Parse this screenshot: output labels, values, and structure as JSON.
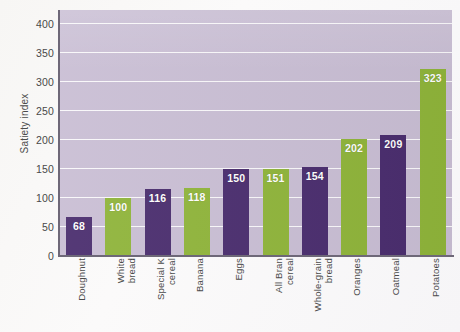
{
  "chart_data": {
    "type": "bar",
    "title": "",
    "xlabel": "",
    "ylabel": "Satiety index",
    "ylim": [
      0,
      425
    ],
    "yticks": [
      0,
      50,
      100,
      150,
      200,
      250,
      300,
      350,
      400
    ],
    "ytick_labels": [
      "0",
      "50",
      "100",
      "150",
      "200",
      "250",
      "300",
      "350",
      "400"
    ],
    "grid": true,
    "gridlines": "horizontal",
    "legend": "none",
    "categories": [
      "Doughnut",
      "White bread",
      "Special K cereal",
      "Banana",
      "Eggs",
      "All Bran cereal",
      "Whole-grain bread",
      "Oranges",
      "Oatmeal",
      "Potatoes"
    ],
    "category_lines": [
      [
        "Doughnut"
      ],
      [
        "White",
        "bread"
      ],
      [
        "Special K",
        "cereal"
      ],
      [
        "Banana"
      ],
      [
        "Eggs"
      ],
      [
        "All Bran",
        "cereal"
      ],
      [
        "Whole-grain",
        "bread"
      ],
      [
        "Oranges"
      ],
      [
        "Oatmeal"
      ],
      [
        "Potatoes"
      ]
    ],
    "values": [
      68,
      100,
      116,
      118,
      150,
      151,
      154,
      202,
      209,
      323
    ],
    "value_labels": [
      "68",
      "100",
      "116",
      "118",
      "150",
      "151",
      "154",
      "202",
      "209",
      "323"
    ],
    "bar_colors": [
      "#4a2d6e",
      "#8fb43a",
      "#4a2d6e",
      "#8fb43a",
      "#4a2d6e",
      "#8fb43a",
      "#4a2d6e",
      "#8fb43a",
      "#4a2d6e",
      "#8fb43a"
    ]
  },
  "colors": {
    "plot_background": "#c9bed4",
    "gridline": "#fdfdfd",
    "axis": "#6e6878",
    "bar_purple": "#4a2d6e",
    "bar_green": "#8fb43a",
    "value_label": "#ffffff",
    "tick_text": "#494949",
    "page_background": "#f8f7f6"
  }
}
